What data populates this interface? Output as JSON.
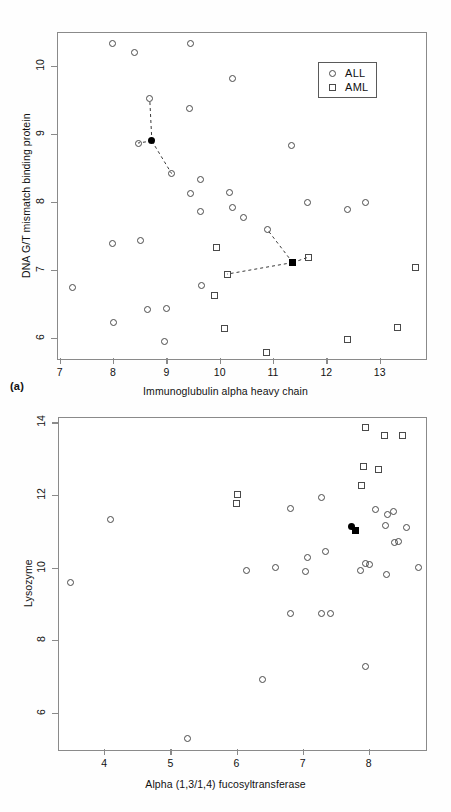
{
  "figure": {
    "panel_a_tag": "(a)",
    "panel_b_tag": "(b)",
    "legend_all": "ALL",
    "legend_aml": "AML"
  },
  "chart_data": [
    {
      "id": "panel-a",
      "type": "scatter",
      "title": "",
      "xlabel": "Immunoglubulin alpha heavy chain",
      "ylabel": "DNA G/T mismatch binding protein",
      "xlim": [
        6.95,
        13.85
      ],
      "ylim": [
        5.7,
        10.5
      ],
      "xticks": [
        7,
        8,
        9,
        10,
        11,
        12,
        13
      ],
      "yticks": [
        6,
        7,
        8,
        9,
        10
      ],
      "grid": false,
      "legend_position": "top-right",
      "series": [
        {
          "name": "ALL",
          "marker": "circle-open",
          "points": [
            [
              7.97,
              10.34
            ],
            [
              8.38,
              10.21
            ],
            [
              9.43,
              10.34
            ],
            [
              10.23,
              9.83
            ],
            [
              8.67,
              9.53
            ],
            [
              9.42,
              9.39
            ],
            [
              11.33,
              8.85
            ],
            [
              9.08,
              8.43
            ],
            [
              9.63,
              8.34
            ],
            [
              10.16,
              8.15
            ],
            [
              9.43,
              8.13
            ],
            [
              10.23,
              7.93
            ],
            [
              8.45,
              8.88
            ],
            [
              9.62,
              7.87
            ],
            [
              10.42,
              7.79
            ],
            [
              11.62,
              8.0
            ],
            [
              12.72,
              8.0
            ],
            [
              12.37,
              7.9
            ],
            [
              10.88,
              7.6
            ],
            [
              7.98,
              7.4
            ],
            [
              8.5,
              7.44
            ],
            [
              7.23,
              6.76
            ],
            [
              9.64,
              6.78
            ],
            [
              7.99,
              6.24
            ],
            [
              8.63,
              6.43
            ],
            [
              8.98,
              6.44
            ],
            [
              8.95,
              5.96
            ]
          ]
        },
        {
          "name": "AML",
          "marker": "square-open",
          "points": [
            [
              9.92,
              7.34
            ],
            [
              11.65,
              7.2
            ],
            [
              13.65,
              7.04
            ],
            [
              10.12,
              6.95
            ],
            [
              9.88,
              6.63
            ],
            [
              10.08,
              6.15
            ],
            [
              13.32,
              6.17
            ],
            [
              12.37,
              5.99
            ],
            [
              10.85,
              5.79
            ]
          ]
        },
        {
          "name": "ALL-centroid",
          "marker": "circle-filled",
          "points": [
            [
              8.71,
              8.91
            ]
          ]
        },
        {
          "name": "AML-centroid",
          "marker": "square-filled",
          "points": [
            [
              11.35,
              7.12
            ]
          ]
        }
      ],
      "connections": [
        {
          "from": [
            8.71,
            8.91
          ],
          "to": [
            8.67,
            9.53
          ]
        },
        {
          "from": [
            8.71,
            8.91
          ],
          "to": [
            8.45,
            8.88
          ]
        },
        {
          "from": [
            8.71,
            8.91
          ],
          "to": [
            9.08,
            8.43
          ]
        },
        {
          "from": [
            11.35,
            7.12
          ],
          "to": [
            10.88,
            7.6
          ]
        },
        {
          "from": [
            11.35,
            7.12
          ],
          "to": [
            11.65,
            7.2
          ]
        },
        {
          "from": [
            11.35,
            7.12
          ],
          "to": [
            10.12,
            6.95
          ]
        }
      ]
    },
    {
      "id": "panel-b",
      "type": "scatter",
      "title": "",
      "xlabel": "Alpha (1,3/1,4) fucosyltransferase",
      "ylabel": "Lysozyme",
      "xlim": [
        3.3,
        8.85
      ],
      "ylim": [
        5.0,
        14.15
      ],
      "xticks": [
        4,
        5,
        6,
        7,
        8
      ],
      "yticks": [
        6,
        8,
        10,
        12,
        14
      ],
      "grid": false,
      "legend_position": "bottom-left",
      "series": [
        {
          "name": "ALL",
          "marker": "circle-open",
          "points": [
            [
              4.08,
              11.35
            ],
            [
              3.47,
              9.61
            ],
            [
              6.14,
              9.94
            ],
            [
              6.57,
              10.03
            ],
            [
              6.8,
              11.66
            ],
            [
              7.03,
              9.92
            ],
            [
              7.06,
              10.3
            ],
            [
              7.27,
              11.97
            ],
            [
              7.33,
              10.47
            ],
            [
              7.86,
              9.95
            ],
            [
              7.93,
              10.15
            ],
            [
              8.0,
              10.1
            ],
            [
              8.08,
              11.64
            ],
            [
              8.27,
              11.48
            ],
            [
              8.36,
              11.56
            ],
            [
              8.24,
              11.2
            ],
            [
              8.55,
              11.14
            ],
            [
              8.37,
              10.72
            ],
            [
              8.43,
              10.74
            ],
            [
              8.25,
              9.85
            ],
            [
              8.74,
              10.02
            ],
            [
              6.8,
              8.76
            ],
            [
              7.27,
              8.77
            ],
            [
              7.4,
              8.75
            ],
            [
              7.93,
              7.31
            ],
            [
              6.37,
              6.95
            ],
            [
              5.25,
              5.33
            ]
          ]
        },
        {
          "name": "AML",
          "marker": "square-open",
          "points": [
            [
              6.0,
              12.05
            ],
            [
              5.98,
              11.78
            ],
            [
              7.93,
              13.88
            ],
            [
              8.22,
              13.68
            ],
            [
              8.5,
              13.68
            ],
            [
              7.91,
              12.8
            ],
            [
              8.13,
              12.74
            ],
            [
              7.88,
              12.28
            ]
          ]
        },
        {
          "name": "ALL-centroid",
          "marker": "circle-filled",
          "points": [
            [
              7.72,
              11.16
            ]
          ]
        },
        {
          "name": "AML-centroid",
          "marker": "square-filled",
          "points": [
            [
              7.79,
              11.05
            ]
          ]
        }
      ],
      "connections": []
    }
  ]
}
